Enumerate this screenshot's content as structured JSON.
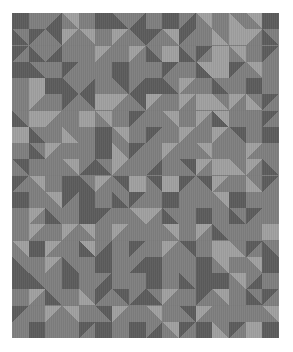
{
  "image": {
    "description": "Geometric quilt pattern of gray squares and half-square triangles",
    "columns": 16,
    "rows": 20,
    "palette": {
      "D": "#5c5c5c",
      "M": "#7f7f7f",
      "L": "#a0a0a0"
    },
    "cell_legend": {
      "s": "solid square (colorA)",
      "a": "split '\\' diagonal: top-right triangle colorA, bottom-left triangle colorB",
      "b": "split '/' diagonal: top-left triangle colorA, bottom-right triangle colorB"
    },
    "grid": [
      [
        "sDD",
        "sMM",
        "bMD",
        "aLM",
        "sMM",
        "sDD",
        "aMD",
        "bMD",
        "sMM",
        "sDD",
        "bMD",
        "aLM",
        "sMM",
        "aML",
        "aLM",
        "sDD"
      ],
      [
        "aMD",
        "bDM",
        "aDM",
        "bLM",
        "aLM",
        "bMM",
        "bLM",
        "aDM",
        "bDM",
        "aLM",
        "bDM",
        "sMM",
        "aML",
        "sLL",
        "bLM",
        "aMD"
      ],
      [
        "bDM",
        "aMD",
        "bMD",
        "aMM",
        "aMM",
        "bLM",
        "sMM",
        "bLM",
        "aMD",
        "sLL",
        "aMD",
        "bDM",
        "sLL",
        "aLM",
        "sMM",
        "bDM"
      ],
      [
        "sDD",
        "aMD",
        "sMM",
        "bDM",
        "aMM",
        "sMM",
        "sDD",
        "aMM",
        "sMM",
        "bDM",
        "sMM",
        "aLD",
        "sLL",
        "bDM",
        "aLM",
        "sMM"
      ],
      [
        "sMM",
        "sLL",
        "sDD",
        "aMD",
        "bMD",
        "sMM",
        "aDM",
        "bMD",
        "sDD",
        "aMD",
        "bLM",
        "sMM",
        "aMD",
        "sMM",
        "sDD",
        "sMM"
      ],
      [
        "aMM",
        "bLM",
        "aMM",
        "bDM",
        "aDM",
        "sLL",
        "bLM",
        "aDM",
        "bLM",
        "aMM",
        "bLM",
        "sLL",
        "aML",
        "bLM",
        "aML",
        "bDM"
      ],
      [
        "aMD",
        "sLL",
        "bLM",
        "aMM",
        "sLL",
        "aLM",
        "sMM",
        "bDM",
        "sMM",
        "aLM",
        "sMM",
        "bLM",
        "aLD",
        "sMM",
        "aMM",
        "bDM"
      ],
      [
        "sLL",
        "aMD",
        "sMM",
        "aML",
        "sMM",
        "sDD",
        "aLM",
        "sMM",
        "bDM",
        "sMM",
        "bLM",
        "sMM",
        "bLM",
        "aDM",
        "sMM",
        "sDD"
      ],
      [
        "sMM",
        "aMD",
        "bLM",
        "aMM",
        "sMM",
        "sDD",
        "aML",
        "bDM",
        "sMM",
        "bLM",
        "aMM",
        "aLM",
        "bMM",
        "sMM",
        "bLM",
        "sMM"
      ],
      [
        "aDM",
        "sMM",
        "bMM",
        "aLM",
        "bMD",
        "aMD",
        "bLM",
        "sMM",
        "bMD",
        "sMM",
        "aDM",
        "bLM",
        "sLL",
        "aML",
        "bLM",
        "aMD"
      ],
      [
        "bDM",
        "aLM",
        "sMM",
        "sDD",
        "aMD",
        "bLM",
        "aDM",
        "sLL",
        "aDM",
        "sLL",
        "bDM",
        "aDM",
        "bLM",
        "sMM",
        "aML",
        "bDM"
      ],
      [
        "sDD",
        "sMM",
        "aLM",
        "bDM",
        "sDD",
        "sMM",
        "aMD",
        "bDM",
        "sMM",
        "sDD",
        "sMM",
        "sMM",
        "aLM",
        "sDD",
        "sMM",
        "aMM"
      ],
      [
        "sMM",
        "bLM",
        "aMD",
        "sMM",
        "sDD",
        "bDM",
        "sMM",
        "aLM",
        "bLM",
        "aMD",
        "sMM",
        "sDD",
        "sMM",
        "aMD",
        "bDM",
        "sMM"
      ],
      [
        "aMM",
        "bLM",
        "aMM",
        "bLM",
        "aLM",
        "sMM",
        "bLM",
        "aMM",
        "sMM",
        "aLM",
        "sMM",
        "bLM",
        "aMD",
        "sMM",
        "aMM",
        "sLL"
      ],
      [
        "aLM",
        "sDD",
        "bLM",
        "sMM",
        "aLD",
        "bMD",
        "aMM",
        "bDM",
        "sMM",
        "bLM",
        "aDM",
        "bMM",
        "sLL",
        "aML",
        "bDM",
        "aMD"
      ],
      [
        "aMD",
        "sMM",
        "bLM",
        "aMD",
        "sMM",
        "sDD",
        "aMM",
        "bMD",
        "sDD",
        "aMM",
        "sMM",
        "sDD",
        "aLM",
        "sMM",
        "aLM",
        "sDD"
      ],
      [
        "sDD",
        "aMD",
        "sMM",
        "sDD",
        "sMM",
        "bMD",
        "sMM",
        "aMM",
        "sDD",
        "sMM",
        "aMD",
        "sDD",
        "sDD",
        "aLM",
        "bMD",
        "sMM"
      ],
      [
        "aMM",
        "bLM",
        "aMD",
        "bMM",
        "aML",
        "bDM",
        "aDM",
        "bMD",
        "aMD",
        "bLM",
        "sMM",
        "bDM",
        "aLM",
        "sMM",
        "aMD",
        "bDM"
      ],
      [
        "bDM",
        "aMM",
        "bLM",
        "aLM",
        "sMM",
        "aDM",
        "bLM",
        "sMM",
        "aLM",
        "sMM",
        "aDM",
        "bLM",
        "sMM",
        "aMM",
        "sMM",
        "aLM"
      ],
      [
        "sMM",
        "sDD",
        "sMM",
        "aMM",
        "bDM",
        "sDD",
        "sMM",
        "sDD",
        "bMD",
        "aLM",
        "bDM",
        "sDD",
        "aML",
        "bDM",
        "sLL",
        "sDD"
      ]
    ]
  }
}
